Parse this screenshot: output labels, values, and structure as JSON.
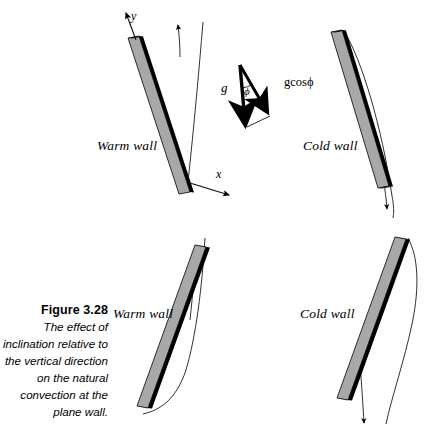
{
  "figure": {
    "background_color": "#ffffff",
    "wall_fill_color": "#a8a8a8",
    "wall_edge_color": "#000000",
    "line_color": "#1a1a1a",
    "caption": {
      "title": "Figure 3.28",
      "body": "The effect of inclination relative to the vertical direction on the natural convection at the plane wall."
    },
    "vector_diagram": {
      "gravity_label": "g",
      "component_label": "gcosϕ",
      "angle_label": "ϕ"
    },
    "axes": {
      "y_label": "y",
      "x_label": "x"
    },
    "panels": [
      {
        "id": "top-left",
        "label": "Warm wall",
        "wall_type": "warm",
        "flow_direction": "upward",
        "inclination": "tilted-right-from-vertical",
        "has_axes": true
      },
      {
        "id": "top-right",
        "label": "Cold wall",
        "wall_type": "cold",
        "flow_direction": "downward",
        "inclination": "tilted-right-from-vertical",
        "has_axes": false
      },
      {
        "id": "bottom-left",
        "label": "Warm wall",
        "wall_type": "warm",
        "flow_direction": "upward",
        "inclination": "tilted-left-from-vertical",
        "has_axes": false
      },
      {
        "id": "bottom-right",
        "label": "Cold wall",
        "wall_type": "cold",
        "flow_direction": "downward",
        "inclination": "tilted-left-from-vertical",
        "has_axes": false
      }
    ]
  }
}
